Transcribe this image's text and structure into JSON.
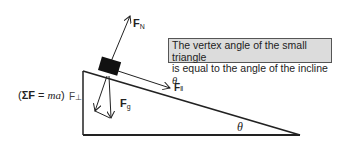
{
  "diagram": {
    "equation_label": {
      "open": "(",
      "sigma": "ΣF",
      "eq": " = ",
      "ma": "ma",
      "close": ")"
    },
    "forces": {
      "normal": {
        "symbol": "F",
        "subscript": "N"
      },
      "parallel": {
        "symbol": "F",
        "subscript": "‖"
      },
      "gravity": {
        "symbol": "F",
        "subscript": "g"
      },
      "perpendicular": {
        "symbol": "F",
        "subscript": "⊥"
      }
    },
    "note": {
      "line1": "The vertex angle of the small triangle",
      "line2": "is equal to the angle of the incline ",
      "theta": "θ."
    },
    "angle_label": "θ",
    "colors": {
      "line": "#222222",
      "block": "#111111",
      "note_background": "#dcdcdc",
      "note_border": "#555555"
    }
  }
}
